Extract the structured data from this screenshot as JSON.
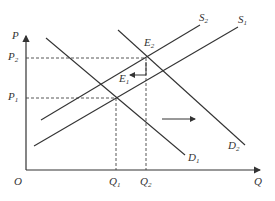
{
  "diagram": {
    "type": "supply-demand",
    "axes": {
      "origin": "O",
      "y_label": "P",
      "x_label": "Q"
    },
    "price_levels": [
      {
        "name": "P",
        "sub": "2",
        "y": 58
      },
      {
        "name": "P",
        "sub": "1",
        "y": 98
      }
    ],
    "quantity_levels": [
      {
        "name": "Q",
        "sub": "1",
        "x": 116
      },
      {
        "name": "Q",
        "sub": "2",
        "x": 146
      }
    ],
    "curves": [
      {
        "name": "S",
        "sub": "2",
        "kind": "supply",
        "x1": 41,
        "y1": 120,
        "x2": 200,
        "y2": 25
      },
      {
        "name": "S",
        "sub": "1",
        "kind": "supply",
        "x1": 34,
        "y1": 146,
        "x2": 238,
        "y2": 27
      },
      {
        "name": "D",
        "sub": "1",
        "kind": "demand",
        "x1": 46,
        "y1": 38,
        "x2": 185,
        "y2": 155
      },
      {
        "name": "D",
        "sub": "2",
        "kind": "demand",
        "x1": 118,
        "y1": 30,
        "x2": 245,
        "y2": 145
      }
    ],
    "equilibria": [
      {
        "name": "E",
        "sub": "1",
        "x": 116,
        "y": 98
      },
      {
        "name": "E",
        "sub": "2",
        "x": 146,
        "y": 58
      }
    ],
    "arrows": [
      {
        "meaning": "supply-shift-left",
        "x1": 146,
        "y1": 75,
        "x2": 130,
        "y2": 75
      },
      {
        "meaning": "demand-shift-right",
        "x1": 162,
        "y1": 119,
        "x2": 195,
        "y2": 119
      }
    ],
    "colors": {
      "line": "#333333",
      "background": "#ffffff"
    }
  },
  "labels": {
    "O": "O",
    "P_axis": "P",
    "Q_axis": "Q",
    "P2": "P",
    "P2_sub": "2",
    "P1": "P",
    "P1_sub": "1",
    "Q1": "Q",
    "Q1_sub": "1",
    "Q2": "Q",
    "Q2_sub": "2",
    "S1": "S",
    "S1_sub": "1",
    "S2": "S",
    "S2_sub": "2",
    "D1": "D",
    "D1_sub": "1",
    "D2": "D",
    "D2_sub": "2",
    "E1": "E",
    "E1_sub": "1",
    "E2": "E",
    "E2_sub": "2"
  }
}
